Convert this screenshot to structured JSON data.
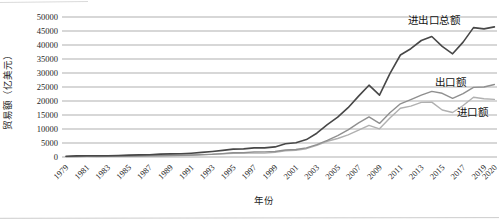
{
  "figure": {
    "background": "#ffffff",
    "grid_color": "#8d8d8d"
  },
  "chart_data": {
    "type": "line",
    "title": "",
    "xlabel": "年份",
    "ylabel": "贸易额（亿美元）",
    "x_start_year": 1979,
    "x_end_year": 2020,
    "xtick_labels": [
      "1979",
      "1981",
      "1983",
      "1985",
      "1987",
      "1989",
      "1991",
      "1993",
      "1995",
      "1997",
      "1999",
      "2001",
      "2003",
      "2005",
      "2007",
      "2009",
      "2011",
      "2013",
      "2015",
      "2017",
      "2019",
      "2020"
    ],
    "yticks": [
      0,
      5000,
      10000,
      15000,
      20000,
      25000,
      30000,
      35000,
      40000,
      45000,
      50000
    ],
    "ylim": [
      0,
      50000
    ],
    "grid": "horizontal",
    "legend_position": "inline-annotations",
    "series": [
      {
        "name": "进出口总额",
        "color": "#474747",
        "width": 1.6,
        "values": [
          293,
          381,
          440,
          416,
          436,
          536,
          696,
          739,
          827,
          1028,
          1117,
          1154,
          1357,
          1656,
          1957,
          2366,
          2809,
          2899,
          3252,
          3240,
          3606,
          4743,
          5097,
          6208,
          8510,
          11546,
          14219,
          17604,
          21738,
          25633,
          22073,
          29740,
          36419,
          38671,
          41590,
          43030,
          39530,
          36856,
          41045,
          46224,
          45761,
          46463
        ]
      },
      {
        "name": "出口额",
        "color": "#8f8f8f",
        "width": 1.4,
        "values": [
          136,
          181,
          220,
          223,
          222,
          261,
          274,
          309,
          394,
          475,
          525,
          621,
          719,
          850,
          917,
          1210,
          1488,
          1511,
          1828,
          1838,
          1949,
          2492,
          2661,
          3256,
          4382,
          5933,
          7620,
          9690,
          12180,
          14307,
          12016,
          15778,
          18984,
          20487,
          22090,
          23422,
          22735,
          20976,
          22633,
          24867,
          24990,
          25900
        ]
      },
      {
        "name": "进口额",
        "color": "#b0b0b0",
        "width": 1.4,
        "values": [
          157,
          200,
          220,
          193,
          214,
          274,
          423,
          429,
          432,
          553,
          591,
          533,
          638,
          806,
          1040,
          1156,
          1321,
          1388,
          1424,
          1402,
          1657,
          2251,
          2436,
          2952,
          4128,
          5612,
          6600,
          7915,
          9558,
          11326,
          10056,
          13962,
          17435,
          18184,
          19500,
          19592,
          16796,
          15879,
          18410,
          21357,
          20771,
          20556
        ]
      }
    ],
    "annotations": [
      {
        "text": "进出口总额",
        "year": 2014.2,
        "value": 48600
      },
      {
        "text": "出口额",
        "year": 2015.8,
        "value": 26600
      },
      {
        "text": "进口额",
        "year": 2017.9,
        "value": 15800
      }
    ]
  }
}
